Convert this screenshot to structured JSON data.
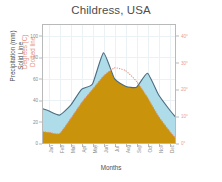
{
  "chart_data": {
    "type": "area",
    "title": "Childress, USA",
    "xlabel": "Months",
    "ylabel": "Precipitation (mm)\nSolid Line",
    "ylabel_line1": "Precipitation (mm)",
    "ylabel_line2": "Solid Line",
    "y2label_line1": "Degrees (C)",
    "y2label_line2": "Dotted line",
    "grid": true,
    "legend": "none",
    "categories": [
      "Jan",
      "Feb",
      "Mar",
      "Apr",
      "May",
      "Jun",
      "Jul",
      "Aug",
      "Sep",
      "Oct",
      "Nov",
      "Dec"
    ],
    "ylim": [
      0,
      110
    ],
    "yticks": [
      0,
      20,
      40,
      60,
      80,
      100
    ],
    "ytick_labels": [
      "0",
      "20",
      "40",
      "60",
      "80",
      "100"
    ],
    "y2lim": [
      0,
      44
    ],
    "y2ticks": [
      0,
      10,
      20,
      30,
      40
    ],
    "y2tick_labels": [
      "0°",
      "10°",
      "20°",
      "30°",
      "40°"
    ],
    "series": [
      {
        "name": "Precipitation (mm)",
        "style": "solid-line-filled-area",
        "fill_color": "#AEDCE8",
        "line_color": "#4a6b80",
        "axis": "left",
        "values": [
          30,
          26,
          35,
          50,
          55,
          84,
          60,
          53,
          52,
          65,
          45,
          31
        ]
      },
      {
        "name": "Degrees (C)",
        "style": "dotted-line",
        "line_color": "#E58F79",
        "axis": "right",
        "values": [
          4,
          3.5,
          9,
          15,
          20,
          25,
          28,
          27,
          23,
          17,
          10,
          4.5
        ]
      }
    ],
    "highlight_band": {
      "name": "dry-season-band",
      "from_month": "Jun",
      "to_month": "Aug",
      "color": "#C9930C",
      "description": "Gold band where temperature curve exceeds precipitation curve"
    },
    "colors": {
      "precipitation_fill": "#AEDCE8",
      "precipitation_line": "#4a6b80",
      "temperature_line": "#E58F79",
      "highlight": "#C9930C",
      "grid": "#EAF2F5",
      "frame": "#B9B9B9",
      "title": "#4D4D4D",
      "axis_text": "#8A8A8A"
    }
  }
}
